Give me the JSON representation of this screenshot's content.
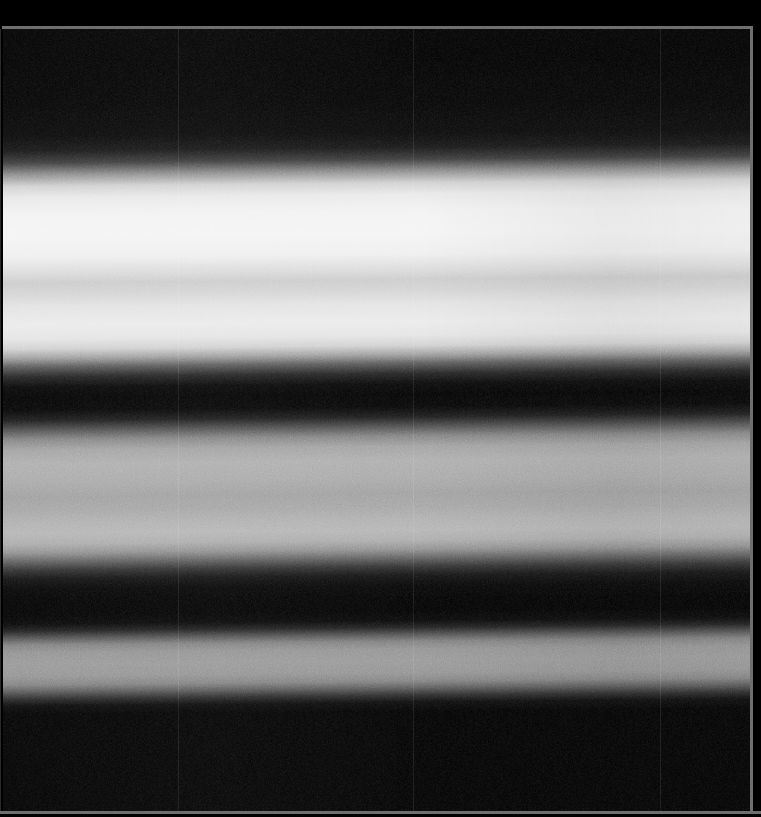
{
  "app": {
    "title": "Spectral Band Image Viewer",
    "mode": "grayscale"
  },
  "image": {
    "name": "spectral-band-raster",
    "description": "Grayscale horizontally-banded spectral raster with sensor grain",
    "width_px": 761,
    "height_px": 817,
    "colorspace": "grayscale",
    "background_color": "#000000",
    "frame_color": "#6e6e6e",
    "border": {
      "top_y": 26,
      "right_x": 750,
      "bottom_y": 811,
      "thickness_px": 3
    },
    "plate": {
      "left": 3,
      "top": 29,
      "width": 747,
      "height": 782
    },
    "band_tilt_deg": -0.55,
    "grain_opacity": 0.3
  },
  "chart_data": {
    "type": "heatmap",
    "title": "",
    "xlabel": "",
    "ylabel": "",
    "orientation": "horizontal-bands",
    "colormap": "gray",
    "value_range": [
      0,
      255
    ],
    "x": [
      0,
      761
    ],
    "y": [
      0,
      817
    ],
    "grid": false,
    "legend": "none",
    "bands": [
      {
        "name": "dark-top",
        "y_start": 29,
        "y_end": 168,
        "level": 4,
        "hex": "#040404"
      },
      {
        "name": "bright-primary",
        "y_start": 168,
        "y_end": 258,
        "level": 244,
        "hex": "#f4f4f4"
      },
      {
        "name": "bright-notch",
        "y_start": 258,
        "y_end": 275,
        "level": 202,
        "hex": "#cacaca"
      },
      {
        "name": "bright-secondary",
        "y_start": 275,
        "y_end": 338,
        "level": 234,
        "hex": "#eaeaea"
      },
      {
        "name": "dark-mid",
        "y_start": 338,
        "y_end": 392,
        "level": 2,
        "hex": "#020202"
      },
      {
        "name": "grey-mid",
        "y_start": 392,
        "y_end": 512,
        "level": 172,
        "hex": "#acacac"
      },
      {
        "name": "dark-lower",
        "y_start": 512,
        "y_end": 566,
        "level": 2,
        "hex": "#020202"
      },
      {
        "name": "grey-lower",
        "y_start": 566,
        "y_end": 620,
        "level": 148,
        "hex": "#949494"
      },
      {
        "name": "dark-bottom",
        "y_start": 620,
        "y_end": 811,
        "level": 0,
        "hex": "#000000"
      }
    ],
    "profile": {
      "axis": "y",
      "samples_y": [
        29,
        80,
        140,
        165,
        178,
        195,
        215,
        240,
        262,
        285,
        310,
        330,
        350,
        368,
        385,
        400,
        430,
        460,
        490,
        508,
        525,
        545,
        560,
        575,
        592,
        608,
        620,
        660,
        720,
        811
      ],
      "samples_value": [
        3,
        4,
        6,
        18,
        95,
        214,
        241,
        244,
        202,
        228,
        234,
        205,
        40,
        2,
        10,
        78,
        168,
        163,
        178,
        158,
        48,
        4,
        10,
        106,
        148,
        134,
        38,
        2,
        1,
        0
      ]
    },
    "seam_lines_x": [
      178,
      413,
      660
    ],
    "seam_opacity": 0.09
  },
  "overlays": {
    "frame_label": "image-frame",
    "seam_label": "detector-seam-line"
  }
}
